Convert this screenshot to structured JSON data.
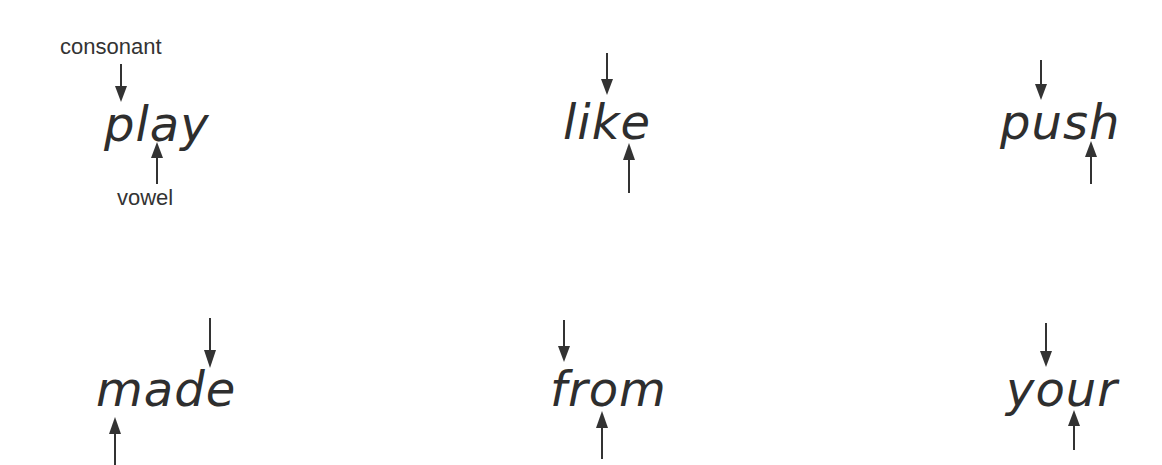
{
  "labels": {
    "consonant": "consonant",
    "vowel": "vowel"
  },
  "words": [
    {
      "text": "play",
      "consonant_marker": "p",
      "vowel_marker": "a"
    },
    {
      "text": "like",
      "consonant_marker": "k",
      "vowel_marker": "e"
    },
    {
      "text": "push",
      "consonant_marker": "s",
      "vowel_marker": "h"
    },
    {
      "text": "made",
      "consonant_marker": "e",
      "vowel_marker": "m"
    },
    {
      "text": "from",
      "consonant_marker": "f",
      "vowel_marker": "o"
    },
    {
      "text": "your",
      "consonant_marker": "o",
      "vowel_marker": "u"
    }
  ],
  "colors": {
    "text": "#2e2e2e",
    "arrow": "#333333",
    "background": "#ffffff"
  }
}
